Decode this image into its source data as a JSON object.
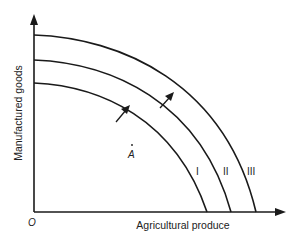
{
  "diagram": {
    "type": "production-possibility-frontier",
    "axes": {
      "x_label": "Agricultural produce",
      "y_label": "Manufactured goods",
      "origin_label": "O"
    },
    "curves": [
      {
        "id": "I",
        "label": "I"
      },
      {
        "id": "II",
        "label": "II"
      },
      {
        "id": "III",
        "label": "III"
      }
    ],
    "points": [
      {
        "id": "A",
        "label": "A"
      }
    ],
    "arrows": [
      {
        "from": "I",
        "to": "II",
        "meaning": "outward shift"
      },
      {
        "from": "II",
        "to": "III",
        "meaning": "outward shift"
      }
    ],
    "colors": {
      "line": "#1a1a1a",
      "text": "#222222",
      "background": "#ffffff"
    }
  }
}
